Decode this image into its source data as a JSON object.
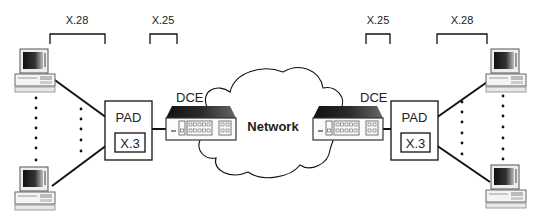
{
  "diagram": {
    "protocol_labels": {
      "left_x28": "X.28",
      "left_x25": "X.25",
      "right_x25": "X.25",
      "right_x28": "X.28"
    },
    "left_pad": {
      "label": "PAD",
      "inner_label": "X.3"
    },
    "right_pad": {
      "label": "PAD",
      "inner_label": "X.3"
    },
    "left_dce": {
      "label": "DCE"
    },
    "right_dce": {
      "label": "DCE"
    },
    "network": {
      "label": "Network"
    },
    "terminals": [
      {
        "side": "left",
        "position": "top",
        "icon": "computer-icon"
      },
      {
        "side": "left",
        "position": "bottom",
        "icon": "computer-icon"
      },
      {
        "side": "right",
        "position": "top",
        "icon": "computer-icon"
      },
      {
        "side": "right",
        "position": "bottom",
        "icon": "computer-icon"
      }
    ],
    "colors": {
      "line": "#111111",
      "fill": "#ffffff",
      "dce_top": "#2a2a2a"
    }
  }
}
